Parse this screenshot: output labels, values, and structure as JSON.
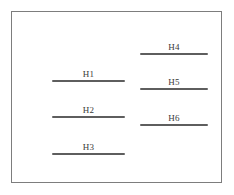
{
  "figure": {
    "type": "line-segment-diagram",
    "frame": {
      "border_color": "#7d7d7d",
      "background_color": "#ffffff"
    },
    "segment_color": "#5e5e5e",
    "label_color": "#3a3a3a",
    "segments": [
      {
        "id": "h1",
        "label": "H1",
        "column": "left",
        "order": 1
      },
      {
        "id": "h2",
        "label": "H2",
        "column": "left",
        "order": 2
      },
      {
        "id": "h3",
        "label": "H3",
        "column": "left",
        "order": 3
      },
      {
        "id": "h4",
        "label": "H4",
        "column": "right",
        "order": 1
      },
      {
        "id": "h5",
        "label": "H5",
        "column": "right",
        "order": 2
      },
      {
        "id": "h6",
        "label": "H6",
        "column": "right",
        "order": 3
      }
    ]
  }
}
